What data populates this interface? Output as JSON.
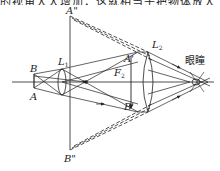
{
  "caption": {
    "text": "的视角大大增加，这就相当于把物体放大了，最终人眼看到的是一个放大的虚像。"
  },
  "diagram": {
    "type": "compound microscope ray diagram",
    "labels": {
      "object_top": "B",
      "object_bottom": "A",
      "objective_lens": "L",
      "objective_lens_sub": "1",
      "eyepiece_lens": "L",
      "eyepiece_lens_sub": "2",
      "intermediate_top": "A'",
      "intermediate_bottom": "B'",
      "focal_point": "F",
      "focal_point_sub": "2",
      "virtual_image_top": "A\"",
      "virtual_image_bottom": "B\"",
      "eye": "眼瞳"
    },
    "colors": {
      "line": "#222222",
      "background": "#ffffff"
    }
  }
}
